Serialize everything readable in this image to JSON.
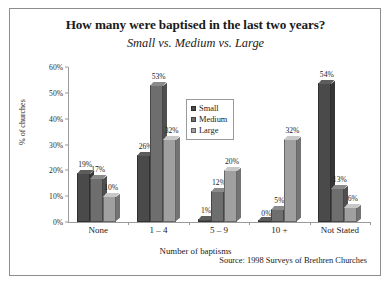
{
  "chart_data": {
    "type": "bar",
    "title": "How many were baptised in the last two years?",
    "subtitle": "Small vs. Medium vs. Large",
    "xlabel": "Number of baptisms",
    "ylabel": "% of churches",
    "categories": [
      "None",
      "1 – 4",
      "5 – 9",
      "10 +",
      "Not Stated"
    ],
    "series": [
      {
        "name": "Small",
        "color": "#4a4a4a",
        "values": [
          19,
          26,
          1,
          0,
          54
        ]
      },
      {
        "name": "Medium",
        "color": "#6e6e6e",
        "values": [
          17,
          53,
          12,
          5,
          13
        ]
      },
      {
        "name": "Large",
        "color": "#a0a0a0",
        "values": [
          10,
          32,
          20,
          32,
          6
        ]
      }
    ],
    "value_labels": [
      [
        "19%",
        "17%",
        "10%"
      ],
      [
        "26%",
        "53%",
        "32%"
      ],
      [
        "1%",
        "12%",
        "20%"
      ],
      [
        "0%",
        "5%",
        "32%"
      ],
      [
        "54%",
        "13%",
        "6%"
      ]
    ],
    "ylim": [
      0,
      60
    ],
    "yticks": [
      "0%",
      "10%",
      "20%",
      "30%",
      "40%",
      "50%",
      "60%"
    ],
    "ytick_values": [
      0,
      10,
      20,
      30,
      40,
      50,
      60
    ],
    "grid": false,
    "legend_position": "inside-upper-center"
  },
  "source": "Source: 1998 Surveys of Brethren Churches"
}
